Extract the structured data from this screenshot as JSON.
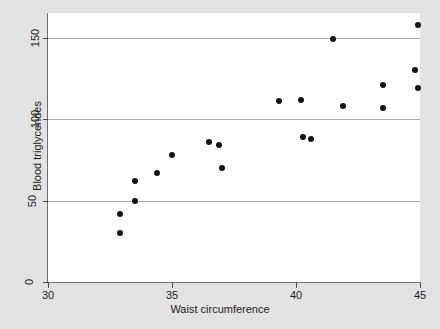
{
  "chart_data": {
    "type": "scatter",
    "title": "",
    "xlabel": "Waist circumference",
    "ylabel": "Blood triglycerides",
    "xlim": [
      30,
      45
    ],
    "ylim": [
      0,
      165
    ],
    "xticks": [
      30,
      35,
      40,
      45
    ],
    "yticks": [
      0,
      50,
      100,
      150
    ],
    "xtick_labels": [
      "30",
      "35",
      "40",
      "45"
    ],
    "ytick_labels": [
      "0",
      "50",
      "100",
      "150"
    ],
    "grid": "horizontal",
    "legend": "none",
    "marker_color": "#141414",
    "grid_color": "#a9a9a9",
    "plot_background": "#ffffff",
    "figure_background": "#e3e3e3",
    "points": [
      {
        "x": 32.9,
        "y": 30
      },
      {
        "x": 32.9,
        "y": 42
      },
      {
        "x": 33.5,
        "y": 50
      },
      {
        "x": 33.5,
        "y": 62
      },
      {
        "x": 34.4,
        "y": 67
      },
      {
        "x": 35.0,
        "y": 78
      },
      {
        "x": 36.5,
        "y": 86
      },
      {
        "x": 36.9,
        "y": 84
      },
      {
        "x": 37.0,
        "y": 70
      },
      {
        "x": 39.3,
        "y": 111
      },
      {
        "x": 40.2,
        "y": 112
      },
      {
        "x": 40.3,
        "y": 89
      },
      {
        "x": 40.6,
        "y": 88
      },
      {
        "x": 41.5,
        "y": 149
      },
      {
        "x": 41.9,
        "y": 108
      },
      {
        "x": 43.5,
        "y": 121
      },
      {
        "x": 43.5,
        "y": 107
      },
      {
        "x": 44.8,
        "y": 130
      },
      {
        "x": 44.9,
        "y": 119
      },
      {
        "x": 44.9,
        "y": 158
      }
    ]
  }
}
